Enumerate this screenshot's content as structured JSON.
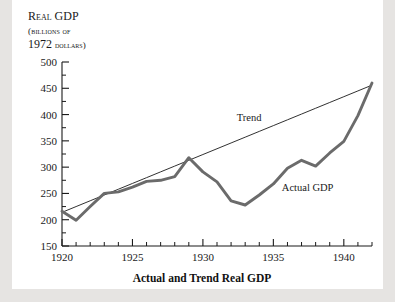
{
  "header": {
    "line1": "Real GDP",
    "line2": "(billions of",
    "line3": "1972 dollars)"
  },
  "chart_data": {
    "type": "line",
    "title": "Actual and Trend Real GDP",
    "xlabel": "",
    "ylabel": "Real GDP (billions of 1972 dollars)",
    "xlim": [
      1920,
      1942
    ],
    "ylim": [
      150,
      500
    ],
    "yticks": [
      150,
      200,
      250,
      300,
      350,
      400,
      450,
      500
    ],
    "xticks": [
      1920,
      1925,
      1930,
      1935,
      1940
    ],
    "xminor_step": 1,
    "grid": false,
    "legend_position": "inline-annotations",
    "x": [
      1920,
      1921,
      1922,
      1923,
      1924,
      1925,
      1926,
      1927,
      1928,
      1929,
      1930,
      1931,
      1932,
      1933,
      1934,
      1935,
      1936,
      1937,
      1938,
      1939,
      1940,
      1941,
      1942
    ],
    "series": [
      {
        "name": "Actual GDP",
        "style": "thick-gray",
        "color": "#6b6b6b",
        "values": [
          216,
          199,
          225,
          250,
          253,
          262,
          273,
          275,
          282,
          318,
          291,
          272,
          236,
          228,
          247,
          268,
          298,
          313,
          302,
          327,
          349,
          398,
          460
        ]
      },
      {
        "name": "Trend",
        "style": "thin-black",
        "color": "#1a1a1a",
        "values": [
          214,
          225,
          236,
          247,
          258,
          269,
          280,
          291,
          302,
          313,
          324,
          335,
          346,
          357,
          368,
          379,
          390,
          401,
          412,
          423,
          434,
          445,
          456
        ]
      }
    ],
    "annotations": [
      {
        "text": "Trend",
        "x": 1932.4,
        "y": 388
      },
      {
        "text": "Actual GDP",
        "x": 1935.6,
        "y": 255
      }
    ]
  },
  "colors": {
    "page_background": "#e6e4e2",
    "sheet_background": "#ffffff",
    "axis": "#1a1a1a",
    "actual_line": "#6b6b6b",
    "trend_line": "#1a1a1a",
    "text": "#1a1a1a"
  }
}
